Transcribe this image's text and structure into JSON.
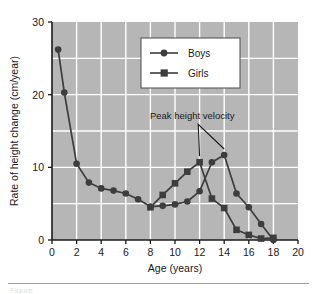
{
  "figure": {
    "caption_partial": "Figure",
    "plot_background_color": "#b6b6b6",
    "grid_color": "#ffffff",
    "series_color": "#3d3d3d",
    "axis_color": "#1a1a1a"
  },
  "chart_data": {
    "type": "line",
    "title": "",
    "xlabel": "Age (years)",
    "ylabel": "Rate of height change (cm/year)",
    "xlim": [
      0,
      20
    ],
    "ylim": [
      0,
      30
    ],
    "xticks": [
      0,
      2,
      4,
      6,
      8,
      10,
      12,
      14,
      16,
      18,
      20
    ],
    "yticks": [
      0,
      10,
      20,
      30
    ],
    "grid": true,
    "legend_position": "upper-center",
    "series": [
      {
        "name": "Boys",
        "marker": "circle",
        "color": "#3d3d3d",
        "x": [
          0.5,
          1,
          2,
          3,
          4,
          5,
          6,
          7,
          8,
          9,
          10,
          11,
          12,
          13,
          14,
          15,
          16,
          17,
          18
        ],
        "values": [
          26.2,
          20.3,
          10.5,
          7.9,
          7.1,
          6.8,
          6.4,
          5.6,
          4.6,
          4.7,
          4.9,
          5.3,
          6.7,
          10.7,
          11.7,
          6.4,
          4.5,
          2.2,
          0.0
        ]
      },
      {
        "name": "Girls",
        "marker": "square",
        "color": "#3d3d3d",
        "x": [
          8,
          9,
          10,
          11,
          12,
          13,
          14,
          15,
          16,
          17,
          18
        ],
        "values": [
          4.5,
          6.2,
          7.8,
          9.4,
          10.7,
          5.7,
          4.4,
          1.4,
          0.7,
          0.2,
          0.3
        ]
      }
    ],
    "annotations": [
      {
        "text": "Peak height velocity",
        "x": 11.4,
        "y": 16.6,
        "pointer_targets": [
          [
            12,
            10.7
          ],
          [
            14,
            11.7
          ]
        ]
      }
    ]
  },
  "legend": {
    "items": [
      {
        "label": "Boys",
        "marker": "circle"
      },
      {
        "label": "Girls",
        "marker": "square"
      }
    ]
  }
}
